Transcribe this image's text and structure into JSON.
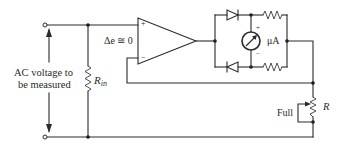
{
  "diagram": {
    "type": "circuit-schematic",
    "labels": {
      "input_line1": "AC voltage to",
      "input_line2": "be measured",
      "rin_main": "R",
      "rin_sub": "in",
      "delta_e": "Δe ≅ 0",
      "plus_input": "+",
      "minus_input": "−",
      "meter_unit": "μA",
      "meter_plus": "+",
      "meter_minus": "−",
      "pot_label": "Full",
      "r_label": "R"
    },
    "components": [
      {
        "id": "input-terminals",
        "kind": "terminal-pair",
        "label": "AC voltage to be measured"
      },
      {
        "id": "rin",
        "kind": "resistor",
        "label": "Rin"
      },
      {
        "id": "opamp",
        "kind": "op-amp",
        "note": "Δe ≅ 0"
      },
      {
        "id": "d1",
        "kind": "diode",
        "position": "bridge-top"
      },
      {
        "id": "d2",
        "kind": "diode",
        "position": "bridge-bottom"
      },
      {
        "id": "r-top",
        "kind": "resistor",
        "position": "bridge-top-right"
      },
      {
        "id": "r-bottom",
        "kind": "resistor",
        "position": "bridge-bottom-right"
      },
      {
        "id": "meter",
        "kind": "microammeter",
        "label": "μA"
      },
      {
        "id": "r-pot",
        "kind": "potentiometer",
        "label": "R",
        "setting": "Full"
      }
    ],
    "colors": {
      "wire": "#2a2a2a",
      "background": "#ffffff"
    }
  }
}
